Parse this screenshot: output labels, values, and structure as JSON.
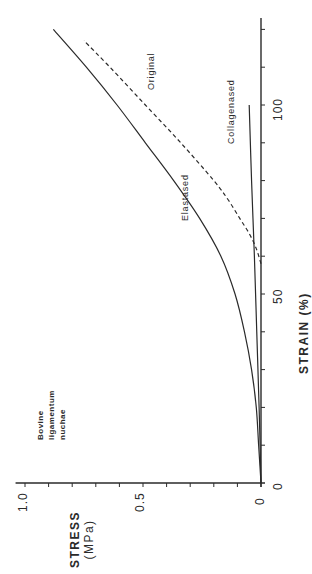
{
  "chart_data": {
    "type": "line",
    "orientation": "rotated-90-ccw",
    "title": "",
    "annotation": "Bovine ligamentum nuchae",
    "xlabel": "STRAIN (%)",
    "ylabel": "STRESS (MPa)",
    "xlim": [
      0,
      123
    ],
    "ylim": [
      0,
      1.0
    ],
    "x_ticks": [
      0,
      50,
      100
    ],
    "x_tick_labels": [
      "0",
      "50",
      "100"
    ],
    "x_minor_step": 10,
    "y_ticks": [
      0,
      0.5,
      1.0
    ],
    "y_tick_labels": [
      "0",
      "0.5",
      "1.0"
    ],
    "y_minor_step": 0.1,
    "grid": false,
    "legend": "none (inline labels)",
    "series": [
      {
        "name": "Original",
        "style": "solid",
        "x": [
          0,
          10,
          20,
          30,
          40,
          50,
          60,
          70,
          80,
          90,
          100,
          110,
          120
        ],
        "y": [
          0,
          0.01,
          0.02,
          0.04,
          0.07,
          0.11,
          0.17,
          0.26,
          0.37,
          0.49,
          0.61,
          0.74,
          0.88
        ]
      },
      {
        "name": "Collagenased",
        "style": "solid",
        "x": [
          0,
          20,
          40,
          60,
          80,
          100
        ],
        "y": [
          0,
          0.008,
          0.018,
          0.028,
          0.04,
          0.05
        ]
      },
      {
        "name": "Elastased",
        "style": "dashed",
        "x": [
          58,
          62,
          66,
          70,
          75,
          80,
          90,
          100,
          110,
          117
        ],
        "y": [
          0,
          0.02,
          0.05,
          0.09,
          0.14,
          0.2,
          0.34,
          0.49,
          0.64,
          0.75
        ]
      }
    ]
  },
  "labels": {
    "note_line1": "Bovine",
    "note_line2": "ligamentum",
    "note_line3": "nuchae",
    "stress_title": "STRESS",
    "stress_unit": "(MPa)",
    "strain_title": "STRAIN (%)",
    "tick_stress_1": "1.0",
    "tick_stress_05": "0.5",
    "tick_stress_0": "0",
    "tick_strain_0": "0",
    "tick_strain_50": "50",
    "tick_strain_100": "100",
    "series_original": "Original",
    "series_collagenased": "Collagenased",
    "series_elastased": "Elastased"
  },
  "colors": {
    "ink": "#2a2a2a",
    "background": "#ffffff"
  }
}
